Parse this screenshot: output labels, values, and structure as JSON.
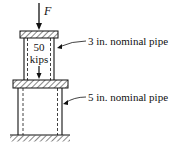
{
  "diagram": {
    "force_label": "F",
    "load_value": "50",
    "load_unit": "kips",
    "upper_pipe_label": "3 in. nominal pipe",
    "lower_pipe_label": "5 in. nominal pipe",
    "colors": {
      "stroke": "#111111",
      "background": "#ffffff"
    }
  }
}
